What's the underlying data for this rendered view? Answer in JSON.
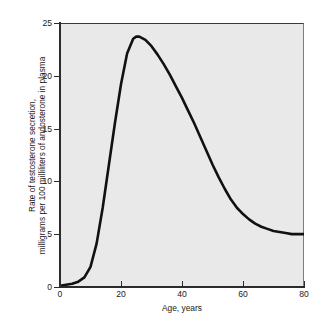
{
  "figure": {
    "background_color": "#ffffff",
    "plot_background_color": "#e9e9e9",
    "curve_color": "#111111"
  },
  "chart_data": {
    "type": "line",
    "title": "",
    "subtitle": "",
    "xlabel": "Age, years",
    "ylabel_line1": "Rate of testosterone secretion,",
    "ylabel_line2": "milligrams per 100 milliliters of andosterone in plasma",
    "ylabel": "Rate of testosterone secretion, milligrams per 100 milliliters of andosterone in plasma",
    "xlim": [
      0,
      80
    ],
    "ylim": [
      0,
      25
    ],
    "xticks": [
      0,
      20,
      40,
      60,
      80
    ],
    "yticks": [
      0,
      5,
      10,
      15,
      20,
      25
    ],
    "xtick_labels": [
      "0",
      "20",
      "40",
      "60",
      "80"
    ],
    "ytick_labels": [
      "0",
      "5",
      "10",
      "15",
      "20",
      "25"
    ],
    "grid": false,
    "legend": false,
    "legend_position": "none",
    "annotations": [],
    "series": [
      {
        "name": "Rate of testosterone secretion",
        "x": [
          0,
          2,
          4,
          6,
          8,
          10,
          12,
          14,
          16,
          18,
          20,
          22,
          24,
          25,
          26,
          28,
          30,
          32,
          34,
          36,
          38,
          40,
          42,
          44,
          46,
          48,
          50,
          52,
          54,
          56,
          58,
          60,
          62,
          64,
          66,
          68,
          70,
          72,
          74,
          76,
          78,
          80
        ],
        "y": [
          0.2,
          0.3,
          0.4,
          0.6,
          1.0,
          2.0,
          4.2,
          7.6,
          11.6,
          15.6,
          19.3,
          22.2,
          23.6,
          23.8,
          23.8,
          23.5,
          22.9,
          22.1,
          21.2,
          20.2,
          19.1,
          18.0,
          16.8,
          15.6,
          14.3,
          13.0,
          11.7,
          10.5,
          9.4,
          8.4,
          7.6,
          7.0,
          6.5,
          6.1,
          5.8,
          5.6,
          5.4,
          5.3,
          5.2,
          5.1,
          5.1,
          5.1
        ]
      }
    ]
  }
}
